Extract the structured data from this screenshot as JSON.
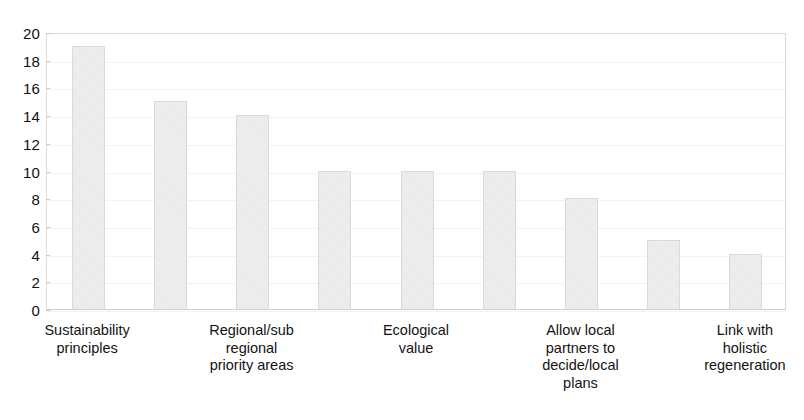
{
  "chart_data": {
    "type": "bar",
    "title": "",
    "subtitle": "",
    "xlabel": "",
    "ylabel": "",
    "ylim": [
      0,
      20
    ],
    "ytick_step": 2,
    "yticks": [
      20,
      18,
      16,
      14,
      12,
      10,
      8,
      6,
      4,
      2,
      0
    ],
    "grid": "horizontal-faint",
    "legend": "none",
    "bar_count": 9,
    "categories": [
      "Sustainability principles",
      "",
      "Regional/sub regional priority areas",
      "",
      "Ecological value",
      "",
      "Allow local partners to decide/local plans",
      "",
      "Link with holistic regeneration"
    ],
    "values": [
      19,
      15,
      14,
      10,
      10,
      10,
      8,
      5,
      4
    ],
    "visible_tick_labels": [
      {
        "bar_index": 0,
        "lines": [
          "Sustainability",
          "principles"
        ]
      },
      {
        "bar_index": 2,
        "lines": [
          "Regional/sub",
          "regional",
          "priority areas"
        ]
      },
      {
        "bar_index": 4,
        "lines": [
          "Ecological",
          "value"
        ]
      },
      {
        "bar_index": 6,
        "lines": [
          "Allow local",
          "partners to",
          "decide/local",
          "plans"
        ]
      },
      {
        "bar_index": 8,
        "lines": [
          "Link with",
          "holistic",
          "regeneration"
        ]
      }
    ],
    "colors": {
      "bar_fill": "#eeeeee",
      "bar_edge": "#dadada",
      "axis_line": "#d8d8d8",
      "gridline": "#f2f2f2",
      "text": "#131313",
      "background": "#ffffff"
    }
  }
}
